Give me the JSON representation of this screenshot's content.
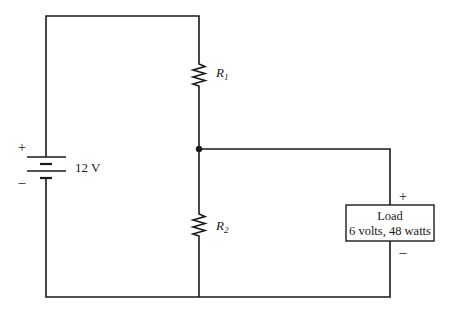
{
  "diagram": {
    "type": "circuit",
    "battery": {
      "label": "12 V",
      "plus_sign": "+",
      "minus_sign": "–"
    },
    "resistors": [
      {
        "id": "R1",
        "symbol": "R",
        "subscript": "1"
      },
      {
        "id": "R2",
        "symbol": "R",
        "subscript": "2"
      }
    ],
    "load": {
      "line1": "Load",
      "line2": "6 volts, 48 watts",
      "plus_sign": "+",
      "minus_sign": "–"
    },
    "colors": {
      "line": "#1a1a1a",
      "background": "#ffffff"
    }
  }
}
